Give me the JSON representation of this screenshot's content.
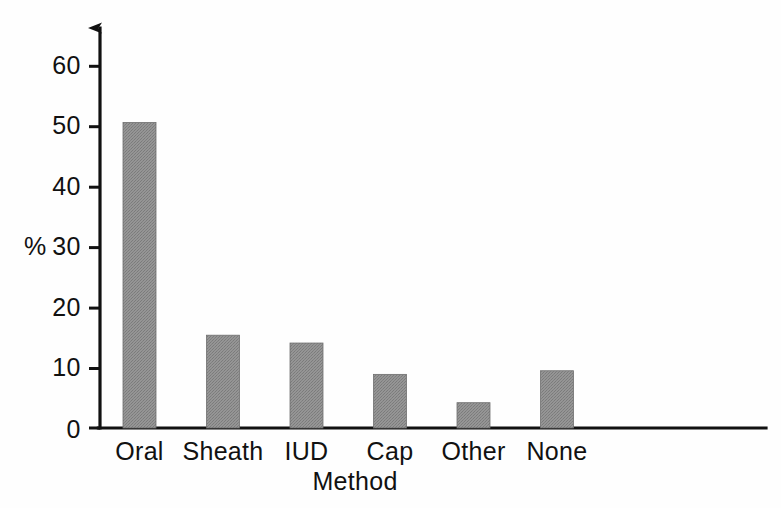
{
  "figure": {
    "background_color": "#fefefe",
    "ink_color": "#111111",
    "bar_fill_color": "#8c8c8c",
    "bar_edge_color": "#6f6f6f"
  },
  "axes": {
    "y_unit_label": "%",
    "x_axis_title": "Method",
    "y_tick_labels": [
      "0",
      "10",
      "20",
      "30",
      "40",
      "50",
      "60"
    ],
    "x_tick_labels": [
      "Oral",
      "Sheath",
      "IUD",
      "Cap",
      "Other",
      "None"
    ],
    "y_axis_has_arrowhead": true
  },
  "chart_data": {
    "type": "bar",
    "title": "",
    "xlabel": "Method",
    "ylabel": "%",
    "categories": [
      "Oral",
      "Sheath",
      "IUD",
      "Cap",
      "Other",
      "None"
    ],
    "values": [
      50.7,
      15.4,
      14.1,
      8.9,
      4.2,
      9.5
    ],
    "ylim": [
      0,
      65
    ],
    "yticks": [
      0,
      10,
      20,
      30,
      40,
      50,
      60
    ],
    "grid": false,
    "legend": null,
    "series": [
      {
        "name": "Percentage of women",
        "values": [
          50.7,
          15.4,
          14.1,
          8.9,
          4.2,
          9.5
        ]
      }
    ]
  }
}
